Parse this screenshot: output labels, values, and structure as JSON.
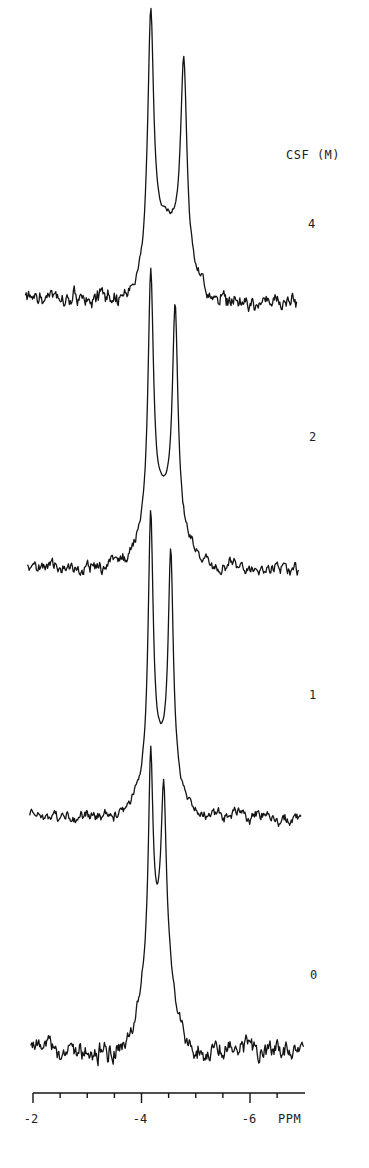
{
  "chart_data": {
    "type": "line",
    "title": "",
    "xlabel": "PPM",
    "legend_title": "CSF (M)",
    "x_axis": {
      "range": [
        -2,
        -6.7
      ],
      "ticks": [
        -2,
        -2.5,
        -3,
        -3.5,
        -4,
        -4.5,
        -5,
        -5.5,
        -6,
        -6.5
      ],
      "tick_labels": [
        {
          "value": -2,
          "label": "-2"
        },
        {
          "value": -4,
          "label": "-4"
        },
        {
          "value": -6,
          "label": "-6"
        }
      ],
      "unit_label": "PPM"
    },
    "grid": false,
    "series": [
      {
        "name": "4",
        "label": "4",
        "baseline_y": 300,
        "x_start_ppm": -1.86,
        "x_end_ppm": -6.87,
        "peaks": [
          {
            "ppm": -4.17,
            "height": 244,
            "width": 0.13
          },
          {
            "ppm": -4.78,
            "height": 203,
            "width": 0.14
          }
        ],
        "broad": {
          "ppm": -4.45,
          "height": 70,
          "width": 0.42
        },
        "noise": 9,
        "seed": 11
      },
      {
        "name": "2",
        "label": "2",
        "baseline_y": 568,
        "x_start_ppm": -1.9,
        "x_end_ppm": -6.9,
        "peaks": [
          {
            "ppm": -4.17,
            "height": 250,
            "width": 0.12
          },
          {
            "ppm": -4.62,
            "height": 214,
            "width": 0.12
          }
        ],
        "broad": {
          "ppm": -4.4,
          "height": 60,
          "width": 0.45
        },
        "noise": 7,
        "seed": 23
      },
      {
        "name": "1",
        "label": "1",
        "baseline_y": 817,
        "x_start_ppm": -1.94,
        "x_end_ppm": -6.94,
        "peaks": [
          {
            "ppm": -4.17,
            "height": 257,
            "width": 0.11
          },
          {
            "ppm": -4.54,
            "height": 219,
            "width": 0.11
          }
        ],
        "broad": {
          "ppm": -4.35,
          "height": 55,
          "width": 0.42
        },
        "noise": 6,
        "seed": 37
      },
      {
        "name": "0",
        "label": "0",
        "baseline_y": 1052,
        "x_start_ppm": -1.96,
        "x_end_ppm": -6.99,
        "peaks": [
          {
            "ppm": -4.17,
            "height": 200,
            "width": 0.1
          },
          {
            "ppm": -4.41,
            "height": 165,
            "width": 0.11
          }
        ],
        "broad": {
          "ppm": -4.3,
          "height": 110,
          "width": 0.35
        },
        "noise": 11,
        "seed": 53
      }
    ]
  },
  "labels": {
    "legend_title": "CSF (M)",
    "series_labels": [
      "4",
      "2",
      "1",
      "0"
    ],
    "axis_unit": "PPM",
    "tick_m2": "-2",
    "tick_m4": "-4",
    "tick_m6": "-6"
  },
  "colors": {
    "ink": "#141414",
    "background": "#ffffff"
  }
}
